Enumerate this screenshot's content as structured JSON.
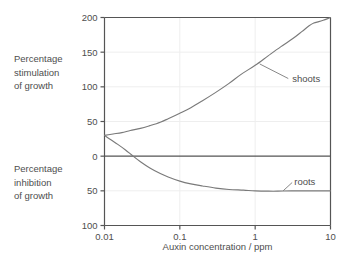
{
  "chart_data": {
    "type": "line",
    "title": "",
    "xlabel": "Auxin concentration / ppm",
    "ylabel": "",
    "xscale": "log",
    "xlim": [
      0.01,
      10
    ],
    "ylim": [
      -100,
      200
    ],
    "grid": true,
    "legend": "inline-annotations",
    "x_ticks": [
      {
        "value": 0.01,
        "label": "0.01"
      },
      {
        "value": 0.1,
        "label": "0.1"
      },
      {
        "value": 1,
        "label": "1"
      },
      {
        "value": 10,
        "label": "10"
      }
    ],
    "y_ticks": [
      {
        "value": 200,
        "label": "200"
      },
      {
        "value": 150,
        "label": "150"
      },
      {
        "value": 100,
        "label": "100"
      },
      {
        "value": 50,
        "label": "50"
      },
      {
        "value": 0,
        "label": "0"
      },
      {
        "value": -50,
        "label": "50"
      },
      {
        "value": -100,
        "label": "100"
      }
    ],
    "zero_line": 0,
    "axis_side_labels": [
      {
        "id": "stimulation",
        "lines": [
          "Percentage",
          "stimulation",
          "of growth"
        ],
        "region": "above-zero"
      },
      {
        "id": "inhibition",
        "lines": [
          "Percentage",
          "inhibition",
          "of growth"
        ],
        "region": "below-zero"
      }
    ],
    "series": [
      {
        "name": "shoots",
        "color": "#7a7a7a",
        "annotation": {
          "label": "shoots",
          "text_x": 3.1,
          "text_y": 112,
          "leader_from_x": 1.15,
          "leader_from_y": 133,
          "leader_to_x": 2.75,
          "leader_to_y": 112
        },
        "points": [
          {
            "x": 0.01,
            "y": 30
          },
          {
            "x": 0.013,
            "y": 32
          },
          {
            "x": 0.017,
            "y": 34
          },
          {
            "x": 0.022,
            "y": 37
          },
          {
            "x": 0.03,
            "y": 40
          },
          {
            "x": 0.04,
            "y": 44
          },
          {
            "x": 0.055,
            "y": 49
          },
          {
            "x": 0.07,
            "y": 54
          },
          {
            "x": 0.1,
            "y": 62
          },
          {
            "x": 0.14,
            "y": 70
          },
          {
            "x": 0.2,
            "y": 80
          },
          {
            "x": 0.3,
            "y": 92
          },
          {
            "x": 0.45,
            "y": 105
          },
          {
            "x": 0.65,
            "y": 118
          },
          {
            "x": 1.0,
            "y": 131
          },
          {
            "x": 1.5,
            "y": 145
          },
          {
            "x": 2.2,
            "y": 158
          },
          {
            "x": 3.2,
            "y": 170
          },
          {
            "x": 4.2,
            "y": 180
          },
          {
            "x": 5.2,
            "y": 188
          },
          {
            "x": 6.0,
            "y": 192
          },
          {
            "x": 7.0,
            "y": 194
          },
          {
            "x": 8.0,
            "y": 196
          },
          {
            "x": 9.0,
            "y": 198
          },
          {
            "x": 10.0,
            "y": 200
          }
        ]
      },
      {
        "name": "roots",
        "color": "#7a7a7a",
        "annotation": {
          "label": "roots",
          "text_x": 3.3,
          "text_y": -36,
          "leader_from_x": 2.35,
          "leader_from_y": -50,
          "leader_to_x": 3.1,
          "leader_to_y": -38
        },
        "points": [
          {
            "x": 0.01,
            "y": 30
          },
          {
            "x": 0.012,
            "y": 24
          },
          {
            "x": 0.015,
            "y": 17
          },
          {
            "x": 0.019,
            "y": 9
          },
          {
            "x": 0.024,
            "y": 0
          },
          {
            "x": 0.03,
            "y": -8
          },
          {
            "x": 0.04,
            "y": -17
          },
          {
            "x": 0.055,
            "y": -25
          },
          {
            "x": 0.07,
            "y": -30
          },
          {
            "x": 0.1,
            "y": -36
          },
          {
            "x": 0.14,
            "y": -40
          },
          {
            "x": 0.2,
            "y": -43
          },
          {
            "x": 0.3,
            "y": -46
          },
          {
            "x": 0.45,
            "y": -48
          },
          {
            "x": 0.7,
            "y": -49
          },
          {
            "x": 1.0,
            "y": -50
          },
          {
            "x": 1.5,
            "y": -50.5
          },
          {
            "x": 2.0,
            "y": -50.5
          },
          {
            "x": 3.0,
            "y": -50
          },
          {
            "x": 5.0,
            "y": -50
          },
          {
            "x": 7.0,
            "y": -50
          },
          {
            "x": 10.0,
            "y": -50
          }
        ]
      }
    ]
  },
  "style": {
    "frame_color": "#555555",
    "grid_color": "#eeeeee",
    "zero_line_color": "#555555",
    "curve_color": "#7a7a7a",
    "text_color": "#4e4e4e",
    "background": "#ffffff"
  }
}
